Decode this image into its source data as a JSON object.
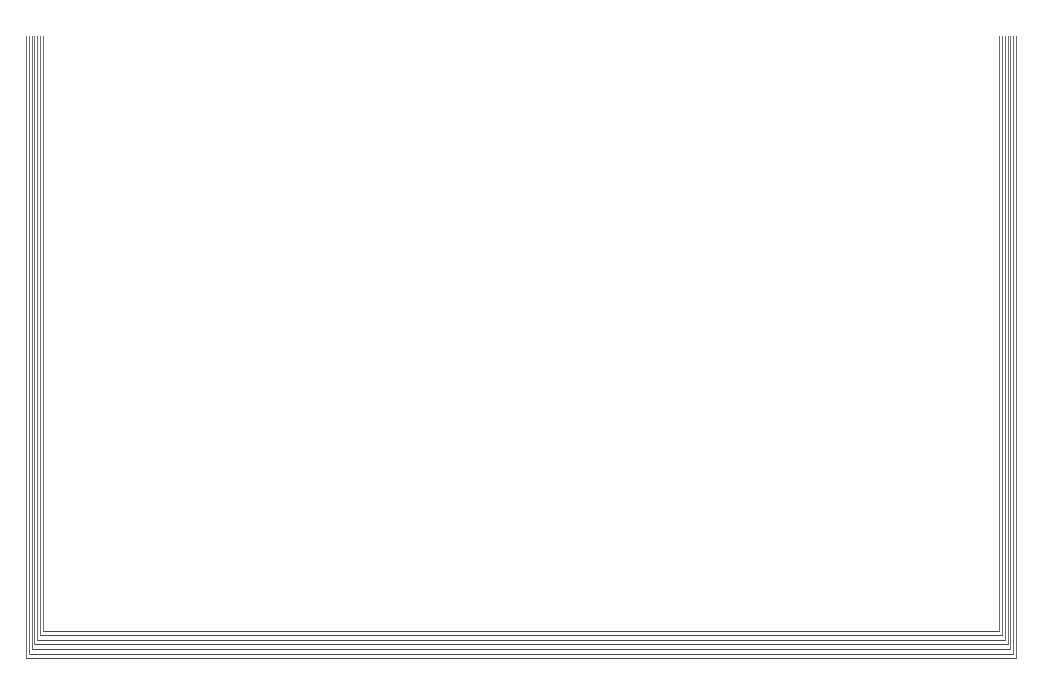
{
  "document": {
    "title_lines": [
      "DCF Analysis",
      "PE Regression Residuals",
      "versus Compound Growth Rate"
    ],
    "plot_legend": "Plot of R*GC.  Symbol used is '*'.",
    "symbol": "*"
  },
  "axis": {
    "y_spine_glyphs": "+\n|\n|\n|\n|\n+\n|\n|\n|\n|\n+\n|\n|\n|\n|\n+",
    "y_title_letters": "R\ne\ns\ni\nd\nu\na\nl",
    "y_title": "Residual",
    "x_rule_glyphs": "---+----------+----------+----------+----------+----------+----------+--",
    "x_title": "Annually Compounded Growth Rate",
    "y_ticks": [
      {
        "label": "2",
        "value": 2
      },
      {
        "label": "0",
        "value": 0
      },
      {
        "label": "-2",
        "value": -2
      },
      {
        "label": "-4",
        "value": -4
      }
    ],
    "x_ticks": [
      {
        "label": "0.00",
        "value": 0.0
      },
      {
        "label": "0.02",
        "value": 0.02
      },
      {
        "label": "0.04",
        "value": 0.04
      },
      {
        "label": "0.06",
        "value": 0.06
      },
      {
        "label": "0.08",
        "value": 0.08
      },
      {
        "label": "0.10",
        "value": 0.1
      },
      {
        "label": "0.12",
        "value": 0.12
      }
    ]
  },
  "chart_data": {
    "type": "scatter",
    "subtitle": "Plot of R*GC.  Symbol used is '*'.",
    "xlabel": "Annually Compounded Growth Rate",
    "ylabel": "Residual",
    "xlim": [
      -0.005,
      0.127
    ],
    "ylim": [
      -4.2,
      2.1
    ],
    "xticks": [
      0.0,
      0.02,
      0.04,
      0.06,
      0.08,
      0.1,
      0.12
    ],
    "yticks": [
      2,
      0,
      -2,
      -4
    ],
    "grid": false,
    "legend": "none",
    "marker": "*",
    "reference_line": {
      "orientation": "horizontal",
      "value": 0,
      "style": "dashed"
    },
    "points": [
      {
        "x": 0.0094,
        "y": 0.03
      },
      {
        "x": 0.0165,
        "y": -1.22
      },
      {
        "x": 0.03,
        "y": 1.77
      },
      {
        "x": 0.033,
        "y": 1.36
      },
      {
        "x": 0.0333,
        "y": 0.49
      },
      {
        "x": 0.0348,
        "y": 0.49
      },
      {
        "x": 0.0342,
        "y": 0.02
      },
      {
        "x": 0.0411,
        "y": 1.36
      },
      {
        "x": 0.0432,
        "y": 1.01
      },
      {
        "x": 0.0452,
        "y": 0.49
      },
      {
        "x": 0.0465,
        "y": 0.02
      },
      {
        "x": 0.0472,
        "y": -0.34
      },
      {
        "x": 0.048,
        "y": -2.2
      },
      {
        "x": 0.0533,
        "y": -1.22
      },
      {
        "x": 0.0562,
        "y": -1.22
      },
      {
        "x": 0.0605,
        "y": 0.49
      },
      {
        "x": 0.067,
        "y": 1.77
      },
      {
        "x": 0.0673,
        "y": 0.49
      },
      {
        "x": 0.0672,
        "y": -0.87
      },
      {
        "x": 0.0676,
        "y": -1.55
      },
      {
        "x": 0.0715,
        "y": -2.2
      },
      {
        "x": 0.1082,
        "y": 1.77
      }
    ]
  },
  "page_stack": {
    "sheet_count": 7
  }
}
